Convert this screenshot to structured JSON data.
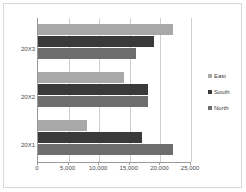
{
  "chart_data": {
    "type": "bar",
    "orientation": "horizontal",
    "title": "",
    "xlabel": "",
    "ylabel": "",
    "categories": [
      "20X3",
      "20X2",
      "20X1"
    ],
    "series": [
      {
        "name": "East",
        "color": "#a8a8a8",
        "values": [
          22000,
          14000,
          8000
        ]
      },
      {
        "name": "South",
        "color": "#3a3a3a",
        "values": [
          19000,
          18000,
          17000
        ]
      },
      {
        "name": "North",
        "color": "#6e6e6e",
        "values": [
          16000,
          18000,
          22000
        ]
      }
    ],
    "xlim": [
      0,
      25000
    ],
    "xticks": [
      0,
      5000,
      10000,
      15000,
      20000,
      25000
    ],
    "xtick_labels": [
      "0",
      "5,000",
      "10,000",
      "15,000",
      "20,000",
      "25,000"
    ],
    "grid": true,
    "grid_axis": "x",
    "legend": [
      "East",
      "South",
      "North"
    ],
    "legend_position": "right",
    "plot_background": "#ffffff",
    "gridline_color": "#cfcfcf",
    "axis_color": "#9a9a9a",
    "border_color": "#d9d9d9"
  }
}
